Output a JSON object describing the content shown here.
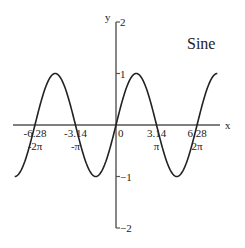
{
  "chart_data": {
    "type": "line",
    "title": "Sine",
    "xlabel": "x",
    "ylabel": "y",
    "function": "y = sin(x)",
    "xlim": [
      -8.3,
      8.0
    ],
    "ylim": [
      -2,
      2
    ],
    "domain": [
      -7.854,
      7.854
    ],
    "grid": false,
    "x_ticks": [
      {
        "value": -6.28,
        "label": "-6.28",
        "sublabel": "-2π"
      },
      {
        "value": -3.14,
        "label": "-3.14",
        "sublabel": "-π"
      },
      {
        "value": 0,
        "label": "0",
        "sublabel": ""
      },
      {
        "value": 3.14,
        "label": "3.14",
        "sublabel": "π"
      },
      {
        "value": 6.28,
        "label": "6.28",
        "sublabel": "2π"
      }
    ],
    "y_ticks": [
      {
        "value": 2,
        "label": "2"
      },
      {
        "value": 1,
        "label": "1"
      },
      {
        "value": -1,
        "label": "−1"
      },
      {
        "value": -2,
        "label": "−2"
      }
    ],
    "series": [
      {
        "name": "sin(x)",
        "color": "#222222",
        "x": [
          -7.854,
          -6.283,
          -4.712,
          -3.142,
          -1.571,
          0,
          1.571,
          3.142,
          4.712,
          6.283,
          7.854
        ],
        "values": [
          -1,
          0,
          1,
          0,
          -1,
          0,
          1,
          0,
          -1,
          0,
          1
        ]
      }
    ]
  },
  "style": {
    "axis_color": "#555555",
    "curve_color": "#222222"
  }
}
